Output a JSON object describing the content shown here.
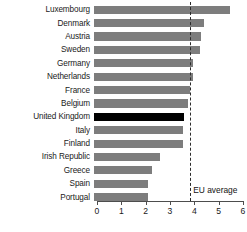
{
  "chart_data": {
    "type": "bar",
    "orientation": "horizontal",
    "title": "",
    "xlabel": "",
    "ylabel": "",
    "xlim": [
      0,
      6
    ],
    "xticks": [
      "0",
      "1",
      "2",
      "3",
      "4",
      "5",
      "6"
    ],
    "grid": false,
    "legend": false,
    "categories": [
      "Luxembourg",
      "Denmark",
      "Austria",
      "Sweden",
      "Germany",
      "Netherlands",
      "France",
      "Belgium",
      "United Kingdom",
      "Italy",
      "Finland",
      "Irish Republic",
      "Greece",
      "Spain",
      "Portugal"
    ],
    "values": [
      5.6,
      4.5,
      4.4,
      4.35,
      4.05,
      4.05,
      3.95,
      3.85,
      3.7,
      3.65,
      3.65,
      2.7,
      2.4,
      2.2,
      2.2
    ],
    "highlight_category": "United Kingdom",
    "colors": {
      "bar": "#7d7d7d",
      "highlight_bar": "#000000",
      "axis": "#4d4d4d",
      "average_line": "#2b2b2b",
      "text": "#1a1a1a"
    },
    "annotations": [
      {
        "name": "eu-average",
        "label": "EU average",
        "value": 3.83,
        "style": "dashed-vertical-line"
      }
    ]
  }
}
